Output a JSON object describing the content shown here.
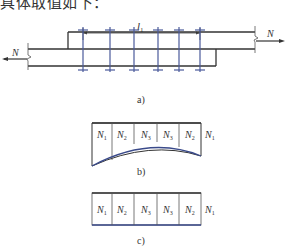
{
  "header": {
    "text": "具体取值如下："
  },
  "figure_a": {
    "caption": "a)",
    "dimension_label": "l",
    "dimension_subscript": "1",
    "force_left": "N",
    "force_right": "N",
    "bolt_rows": 6,
    "colors": {
      "plate": "#333333",
      "bolt": "#4a5a9a"
    }
  },
  "figure_b": {
    "caption": "b)",
    "cells": [
      {
        "base": "N",
        "sub": "1"
      },
      {
        "base": "N",
        "sub": "2"
      },
      {
        "base": "N",
        "sub": "3"
      },
      {
        "base": "N",
        "sub": "3"
      },
      {
        "base": "N",
        "sub": "2"
      }
    ],
    "trailing": {
      "base": "N",
      "sub": "1"
    },
    "description": "curved (non-uniform) bolt force distribution"
  },
  "figure_c": {
    "caption": "c)",
    "cells": [
      {
        "base": "N",
        "sub": "1"
      },
      {
        "base": "N",
        "sub": "2"
      },
      {
        "base": "N",
        "sub": "3"
      },
      {
        "base": "N",
        "sub": "3"
      },
      {
        "base": "N",
        "sub": "2"
      }
    ],
    "trailing": {
      "base": "N",
      "sub": "1"
    },
    "description": "uniform bolt force distribution"
  }
}
